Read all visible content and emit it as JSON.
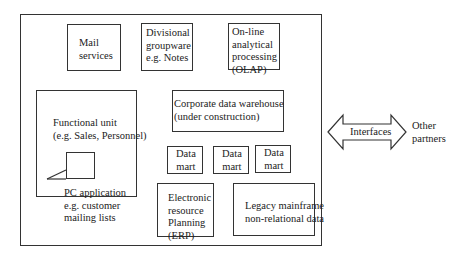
{
  "diagram": {
    "outer_boundary": "Organization",
    "boxes": {
      "mail": {
        "label": "Mail\nservices"
      },
      "groupware": {
        "label": "Divisional\ngroupware\ne.g. Notes"
      },
      "olap": {
        "label": "On-line\nanalytical\nprocessing\n(OLAP)"
      },
      "functional_unit": {
        "label": "Functional unit\n(e.g. Sales, Personnel)"
      },
      "pc_application": {
        "label": "PC application\ne.g. customer\nmailing lists"
      },
      "warehouse": {
        "label": "Corporate data warehouse\n(under construction)"
      },
      "data_marts": [
        {
          "label": "Data\nmart"
        },
        {
          "label": "Data\nmart"
        },
        {
          "label": "Data\nmart"
        }
      ],
      "erp": {
        "label": "Electronic\nresource\nPlanning\n(ERP)"
      },
      "legacy": {
        "label": "Legacy mainframe\nnon-relational data"
      }
    },
    "arrow": {
      "label": "Interfaces",
      "type": "double-headed"
    },
    "external": {
      "label": "Other\npartners"
    }
  }
}
